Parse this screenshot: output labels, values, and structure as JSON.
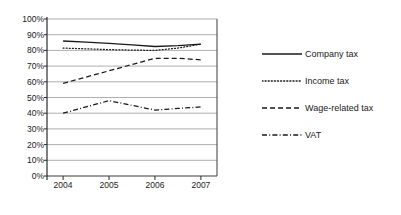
{
  "chart_data": {
    "type": "line",
    "title": "",
    "subtitle": "",
    "xlabel": "",
    "ylabel": "",
    "x": [
      "2004",
      "2005",
      "2006",
      "2007"
    ],
    "categories": [
      "2004",
      "2005",
      "2006",
      "2007"
    ],
    "xlim": [
      2003.65,
      2007.35
    ],
    "ylim": [
      0,
      100
    ],
    "ytick_labels": [
      "100%",
      "90%",
      "80%",
      "70%",
      "60%",
      "50%",
      "40%",
      "30%",
      "20%",
      "10%",
      "0%"
    ],
    "ytick_values": [
      100,
      90,
      80,
      70,
      60,
      50,
      40,
      30,
      20,
      10,
      0
    ],
    "xtick_labels": [
      "2004",
      "2005",
      "2006",
      "2007"
    ],
    "grid": "horizontal",
    "legend_position": "right",
    "series": [
      {
        "name": "Company tax",
        "style": "solid",
        "color": "#1a1a1a",
        "values": [
          86,
          84.5,
          82.5,
          84
        ],
        "dense_x": [
          2004,
          2004.5,
          2005,
          2005.5,
          2006,
          2006.5,
          2007
        ],
        "dense_values": [
          86,
          85.3,
          84.5,
          83.5,
          82.5,
          83,
          84
        ]
      },
      {
        "name": "Income tax",
        "style": "dotted",
        "color": "#1a1a1a",
        "values": [
          81.5,
          80.5,
          80,
          84
        ],
        "dense_x": [
          2004,
          2004.5,
          2005,
          2005.5,
          2006,
          2006.5,
          2007
        ],
        "dense_values": [
          81.5,
          81,
          80.5,
          80.2,
          80,
          81.5,
          84
        ]
      },
      {
        "name": "Wage-related tax",
        "style": "dashed",
        "color": "#1a1a1a",
        "values": [
          59,
          67,
          75,
          74
        ],
        "dense_x": [
          2004,
          2004.5,
          2005,
          2005.5,
          2006,
          2006.5,
          2007
        ],
        "dense_values": [
          59,
          63,
          67,
          71,
          75,
          75,
          74
        ]
      },
      {
        "name": "VAT",
        "style": "dash-dot",
        "color": "#1a1a1a",
        "values": [
          40,
          48,
          42,
          44
        ],
        "dense_x": [
          2004,
          2004.5,
          2005,
          2005.5,
          2006,
          2006.5,
          2007
        ],
        "dense_values": [
          40,
          44,
          48,
          45,
          42,
          43,
          44
        ]
      }
    ]
  },
  "legend": {
    "items": [
      {
        "label": "Company tax",
        "style": "solid"
      },
      {
        "label": "Income tax",
        "style": "dotted"
      },
      {
        "label": "Wage-related tax",
        "style": "dashed"
      },
      {
        "label": "VAT",
        "style": "dash-dot"
      }
    ]
  },
  "axes": {
    "y_ticks": [
      "100%",
      "90%",
      "80%",
      "70%",
      "60%",
      "50%",
      "40%",
      "30%",
      "20%",
      "10%",
      "0%"
    ],
    "x_ticks": [
      "2004",
      "2005",
      "2006",
      "2007"
    ]
  }
}
